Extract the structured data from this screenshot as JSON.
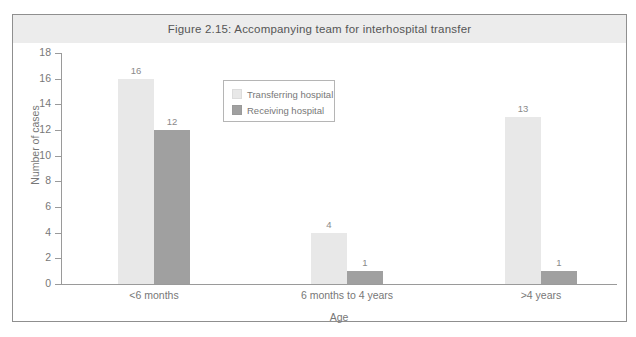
{
  "figure": {
    "title": "Figure 2.15: Accompanying team for interhospital transfer"
  },
  "colors": {
    "transferring_hospital": "#e8e8e8",
    "receiving_hospital": "#a0a0a0",
    "axis": "#9a9a9a",
    "frame_border": "#8f8f8f",
    "title_band": "#ececec",
    "text": "#777777"
  },
  "chart_data": {
    "type": "bar",
    "title": "Figure 2.15: Accompanying team for interhospital transfer",
    "xlabel": "Age",
    "ylabel": "Number of cases",
    "categories": [
      "<6 months",
      "6 months to 4 years",
      ">4 years"
    ],
    "series": [
      {
        "name": "Transferring hospital",
        "values": [
          16,
          4,
          13
        ]
      },
      {
        "name": "Receiving hospital",
        "values": [
          12,
          1,
          1
        ]
      }
    ],
    "ylim": [
      0,
      18
    ],
    "yticks": [
      0,
      2,
      4,
      6,
      8,
      10,
      12,
      14,
      16,
      18
    ],
    "ytick_labels": [
      "0",
      "2",
      "4",
      "6",
      "8",
      "10",
      "12",
      "14",
      "16",
      "18"
    ],
    "grid": false,
    "legend_position": "upper center",
    "data_labels": true
  }
}
